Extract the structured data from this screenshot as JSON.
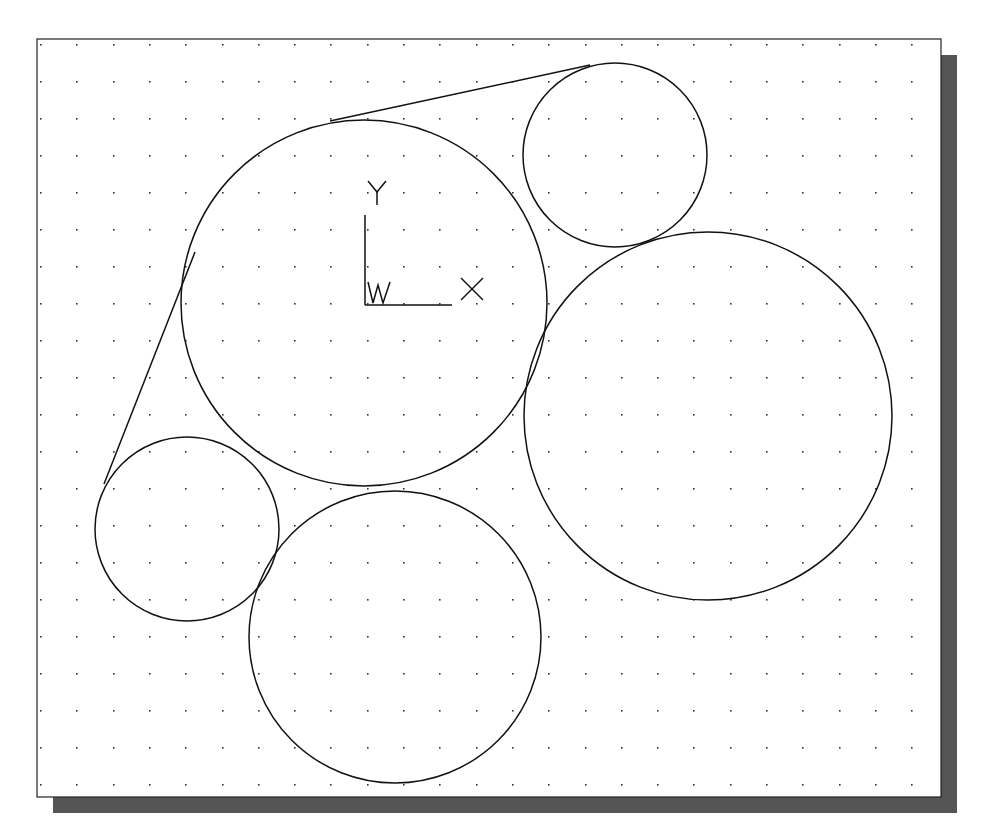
{
  "caption_fragment": "",
  "viewport": {
    "frame": {
      "x": 37,
      "y": 39,
      "width": 904,
      "height": 758,
      "stroke": "#222222",
      "fill": "#ffffff"
    },
    "shadow": {
      "offset": 16,
      "color": "#555555"
    },
    "grid": {
      "start_x": 40,
      "start_y": 44,
      "spacing_x": 36.3,
      "spacing_y": 37,
      "dot_color": "#333333"
    }
  },
  "ucs_icon": {
    "origin": {
      "x": 365,
      "y": 305
    },
    "y_axis_top": 215,
    "x_axis_end": 452,
    "labels": {
      "x": "X",
      "y": "Y",
      "w": "W"
    }
  },
  "geometry": {
    "circles": [
      {
        "name": "large-center-circle",
        "cx": 364,
        "cy": 303,
        "r": 183
      },
      {
        "name": "small-top-right-circle",
        "cx": 615,
        "cy": 155,
        "r": 92
      },
      {
        "name": "large-right-circle",
        "cx": 708,
        "cy": 416,
        "r": 184
      },
      {
        "name": "small-bottom-left-circle",
        "cx": 187,
        "cy": 529,
        "r": 92
      },
      {
        "name": "bottom-circle",
        "cx": 395,
        "cy": 637,
        "r": 146
      }
    ],
    "lines": [
      {
        "name": "top-tangent-line",
        "x1": 330,
        "y1": 121,
        "x2": 590,
        "y2": 65
      },
      {
        "name": "left-tangent-line",
        "x1": 104,
        "y1": 484,
        "x2": 195,
        "y2": 252
      }
    ],
    "stroke": "#111111"
  }
}
